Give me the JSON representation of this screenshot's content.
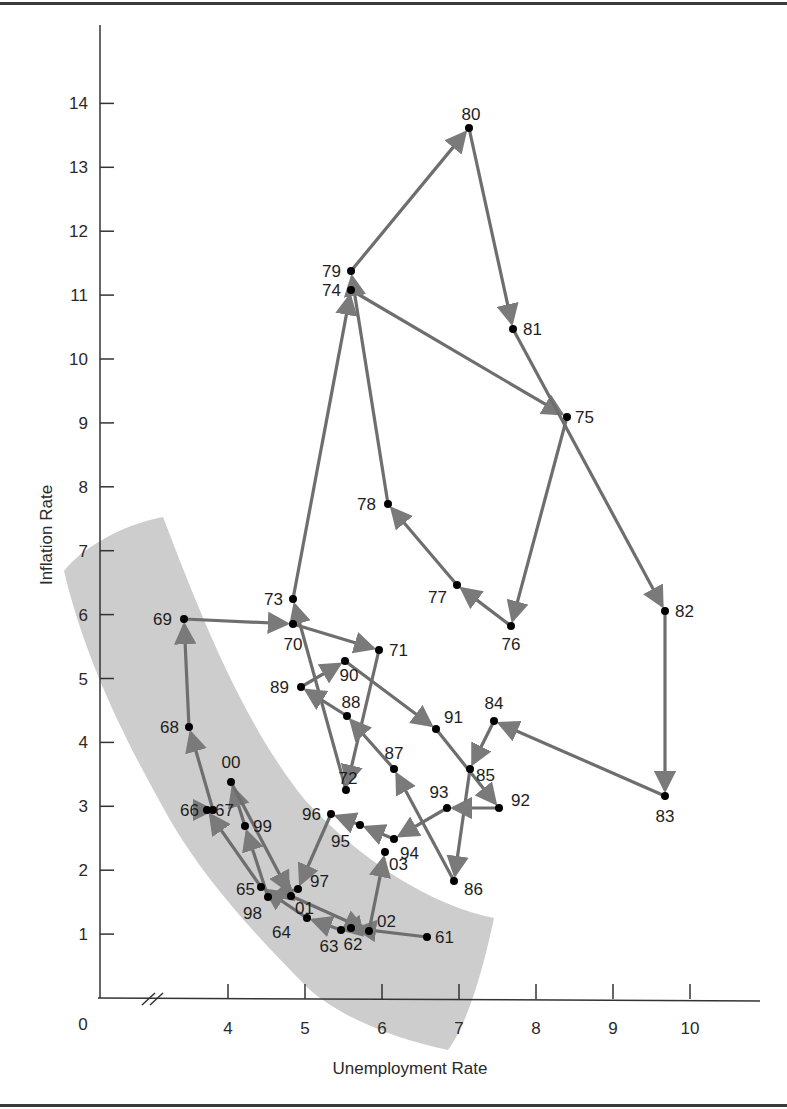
{
  "chart_data": {
    "type": "scatter",
    "subtype": "connected-scatter-with-arrows",
    "title": "",
    "xlabel": "Unemployment Rate",
    "ylabel": "Inflation Rate",
    "x_ticks": [
      "0",
      "4",
      "5",
      "6",
      "7",
      "8",
      "9",
      "10"
    ],
    "y_ticks": [
      "1",
      "2",
      "3",
      "4",
      "5",
      "6",
      "7",
      "8",
      "9",
      "10",
      "11",
      "12",
      "13",
      "14"
    ],
    "x_axis_break": true,
    "xlim": [
      3,
      11
    ],
    "ylim": [
      0,
      14.5
    ],
    "grid": false,
    "legend": null,
    "shaded_band": "Gray curved band running from upper-left (≈3.0, 6.6–7.5) down to lower-right (≈6.5–7.5, 0–1.3), enclosing the 1960s and late-1990s points",
    "points": [
      {
        "label": "61",
        "x": 6.6,
        "y": 1.0
      },
      {
        "label": "62",
        "x": 5.5,
        "y": 1.1
      },
      {
        "label": "63",
        "x": 5.4,
        "y": 1.1
      },
      {
        "label": "64",
        "x": 5.0,
        "y": 1.3
      },
      {
        "label": "65",
        "x": 4.4,
        "y": 1.7
      },
      {
        "label": "66",
        "x": 3.7,
        "y": 2.9
      },
      {
        "label": "67",
        "x": 3.8,
        "y": 2.9
      },
      {
        "label": "68",
        "x": 3.5,
        "y": 4.2
      },
      {
        "label": "69",
        "x": 3.4,
        "y": 5.5
      },
      {
        "label": "70",
        "x": 4.8,
        "y": 5.8
      },
      {
        "label": "71",
        "x": 5.9,
        "y": 5.4
      },
      {
        "label": "72",
        "x": 5.5,
        "y": 3.3
      },
      {
        "label": "73",
        "x": 4.8,
        "y": 6.2
      },
      {
        "label": "74",
        "x": 5.5,
        "y": 11.1
      },
      {
        "label": "75",
        "x": 8.4,
        "y": 9.1
      },
      {
        "label": "76",
        "x": 7.7,
        "y": 5.8
      },
      {
        "label": "77",
        "x": 7.1,
        "y": 6.5
      },
      {
        "label": "78",
        "x": 6.1,
        "y": 7.7
      },
      {
        "label": "79",
        "x": 5.5,
        "y": 11.3
      },
      {
        "label": "80",
        "x": 7.1,
        "y": 13.6
      },
      {
        "label": "81",
        "x": 7.6,
        "y": 10.4
      },
      {
        "label": "82",
        "x": 9.7,
        "y": 6.1
      },
      {
        "label": "83",
        "x": 9.6,
        "y": 3.2
      },
      {
        "label": "84",
        "x": 7.5,
        "y": 4.4
      },
      {
        "label": "85",
        "x": 7.2,
        "y": 3.6
      },
      {
        "label": "86",
        "x": 7.0,
        "y": 1.9
      },
      {
        "label": "87",
        "x": 6.2,
        "y": 3.6
      },
      {
        "label": "88",
        "x": 5.5,
        "y": 4.1
      },
      {
        "label": "89",
        "x": 5.3,
        "y": 4.8
      },
      {
        "label": "90",
        "x": 5.6,
        "y": 5.4
      },
      {
        "label": "91",
        "x": 6.8,
        "y": 4.2
      },
      {
        "label": "92",
        "x": 7.5,
        "y": 3.0
      },
      {
        "label": "93",
        "x": 6.9,
        "y": 3.0
      },
      {
        "label": "94",
        "x": 6.1,
        "y": 2.6
      },
      {
        "label": "95",
        "x": 5.6,
        "y": 2.8
      },
      {
        "label": "96",
        "x": 5.4,
        "y": 2.9
      },
      {
        "label": "97",
        "x": 4.9,
        "y": 2.3
      },
      {
        "label": "98",
        "x": 4.5,
        "y": 1.6
      },
      {
        "label": "99",
        "x": 4.2,
        "y": 2.2
      },
      {
        "label": "00",
        "x": 4.0,
        "y": 3.4
      },
      {
        "label": "01",
        "x": 4.7,
        "y": 1.6
      },
      {
        "label": "02",
        "x": 5.8,
        "y": 1.0
      },
      {
        "label": "03",
        "x": 6.0,
        "y": 2.3
      }
    ],
    "sequence": [
      "61",
      "62",
      "63",
      "64",
      "65",
      "66",
      "67",
      "68",
      "69",
      "70",
      "71",
      "72",
      "73",
      "74",
      "75",
      "76",
      "77",
      "78",
      "79",
      "80",
      "81",
      "82",
      "83",
      "84",
      "85",
      "86",
      "87",
      "88",
      "89",
      "90",
      "91",
      "92",
      "93",
      "94",
      "95",
      "96",
      "97",
      "98",
      "99",
      "00",
      "01",
      "02",
      "03"
    ]
  },
  "axes": {
    "x_title": "Unemployment Rate",
    "y_title": "Inflation Rate",
    "x_origin_label": "0",
    "x_tick_labels": [
      "4",
      "5",
      "6",
      "7",
      "8",
      "9",
      "10"
    ],
    "y_tick_labels": [
      "1",
      "2",
      "3",
      "4",
      "5",
      "6",
      "7",
      "8",
      "9",
      "10",
      "11",
      "12",
      "13",
      "14"
    ]
  },
  "colors": {
    "band": "#cdcdcd",
    "arrow": "#6e6e6e",
    "point": "#000000",
    "axis": "#333333"
  }
}
